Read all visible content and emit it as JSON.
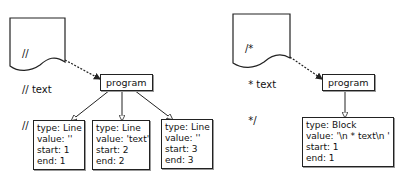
{
  "diagrams": [
    {
      "source_lines": [
        "//",
        "// text",
        "//"
      ],
      "root_label": "program",
      "children": [
        {
          "type_label": "type: Line",
          "value_label": "value: ''",
          "start_label": "start: 1",
          "end_label": "end: 1"
        },
        {
          "type_label": "type: Line",
          "value_label": "value: 'text'",
          "start_label": "start: 2",
          "end_label": "end: 2"
        },
        {
          "type_label": "type: Line",
          "value_label": "value: ''",
          "start_label": "start: 3",
          "end_label": "end: 3"
        }
      ]
    },
    {
      "source_lines": [
        "/*",
        " * text",
        " */"
      ],
      "root_label": "program",
      "children": [
        {
          "type_label": "type: Block",
          "value_label": "value: '\\n * text\\n '",
          "start_label": "start: 1",
          "end_label": "end: 1"
        }
      ]
    }
  ]
}
